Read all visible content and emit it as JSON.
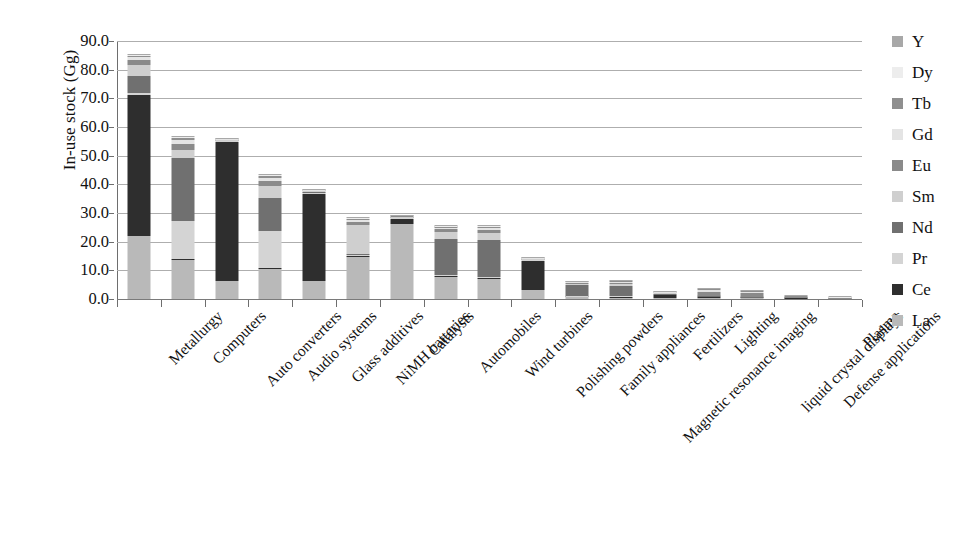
{
  "chart_data": {
    "type": "bar",
    "subtype": "stacked-bar",
    "title": "",
    "xlabel": "",
    "ylabel": "In-use stock (Gg)",
    "ylim": [
      0,
      90
    ],
    "ytick_labels": [
      "90.0",
      "80.0",
      "70.0",
      "60.0",
      "50.0",
      "40.0",
      "30.0",
      "20.0",
      "10.0",
      "0.0"
    ],
    "ytick_values": [
      90,
      80,
      70,
      60,
      50,
      40,
      30,
      20,
      10,
      0
    ],
    "grid": true,
    "legend_position": "right",
    "categories": [
      "Metallurgy",
      "Computers",
      "Auto converters",
      "Audio systems",
      "Glass additives",
      "NiMH batteries",
      "Catalysts",
      "Automobiles",
      "Wind turbines",
      "Polishing powders",
      "Family appliances",
      "Magnetic resonance imaging",
      "Fertilizers",
      "Lighting",
      "liquid crystal displays",
      "Defense applications",
      "Plasma"
    ],
    "series": [
      {
        "name": "La",
        "color": "#b9b9b9",
        "values": [
          22.0,
          13.5,
          6.2,
          10.3,
          6.3,
          14.5,
          26.0,
          7.6,
          7.0,
          3.0,
          0.6,
          0.5,
          0.4,
          0.5,
          0.3,
          0.25,
          0.12
        ]
      },
      {
        "name": "Ce",
        "color": "#2e2e2e",
        "values": [
          49.0,
          0.6,
          48.5,
          0.5,
          30.5,
          0.5,
          1.8,
          0.4,
          0.3,
          10.2,
          0.3,
          0.3,
          1.0,
          0.2,
          0.15,
          0.1,
          0.05
        ]
      },
      {
        "name": "Pr",
        "color": "#d4d4d4",
        "values": [
          0.8,
          13.0,
          0.3,
          13.0,
          0.4,
          0.4,
          0.4,
          0.3,
          0.3,
          0.3,
          0.2,
          0.2,
          0.2,
          0.15,
          0.1,
          0.05,
          0.02
        ]
      },
      {
        "name": "Nd",
        "color": "#707070",
        "values": [
          6.0,
          22.0,
          0.3,
          11.5,
          0.3,
          0.3,
          0.3,
          12.5,
          13.0,
          0.3,
          3.8,
          3.7,
          0.3,
          0.15,
          0.1,
          0.05,
          0.02
        ]
      },
      {
        "name": "Sm",
        "color": "#cfcfcf",
        "values": [
          4.0,
          3.0,
          0.2,
          4.0,
          0.2,
          10.0,
          0.2,
          2.5,
          2.6,
          0.2,
          0.5,
          0.5,
          0.2,
          0.1,
          0.08,
          0.04,
          0.01
        ]
      },
      {
        "name": "Eu",
        "color": "#8a8a8a",
        "values": [
          1.5,
          2.0,
          0.2,
          2.0,
          0.2,
          1.0,
          0.2,
          1.0,
          1.0,
          0.2,
          0.3,
          0.3,
          0.15,
          1.5,
          1.2,
          0.3,
          0.3
        ]
      },
      {
        "name": "Gd",
        "color": "#e4e4e4",
        "values": [
          1.0,
          1.5,
          0.1,
          1.0,
          0.1,
          0.8,
          0.1,
          0.6,
          0.6,
          0.1,
          0.2,
          0.6,
          0.1,
          0.4,
          0.5,
          0.1,
          0.05
        ]
      },
      {
        "name": "Tb",
        "color": "#8f8f8f",
        "values": [
          0.6,
          0.6,
          0.1,
          0.5,
          0.1,
          0.4,
          0.1,
          0.4,
          0.4,
          0.1,
          0.1,
          0.2,
          0.05,
          0.4,
          0.3,
          0.08,
          0.02
        ]
      },
      {
        "name": "Dy",
        "color": "#ededed",
        "values": [
          0.3,
          0.4,
          0.05,
          0.3,
          0.05,
          0.3,
          0.05,
          0.3,
          0.3,
          0.05,
          0.1,
          0.15,
          0.05,
          0.3,
          0.2,
          0.05,
          0.02
        ]
      },
      {
        "name": "Y",
        "color": "#a8a8a8",
        "values": [
          0.3,
          0.4,
          0.05,
          0.4,
          0.05,
          0.3,
          0.05,
          0.3,
          0.3,
          0.05,
          0.1,
          0.15,
          0.05,
          0.3,
          0.2,
          0.05,
          0.02
        ]
      }
    ],
    "totals": [
      85.5,
      57.0,
      56.0,
      43.5,
      38.2,
      28.5,
      29.2,
      25.9,
      25.8,
      14.5,
      6.2,
      6.6,
      2.5,
      3.6,
      3.13,
      1.07,
      0.63
    ],
    "legend_order": [
      "Y",
      "Dy",
      "Tb",
      "Gd",
      "Eu",
      "Sm",
      "Nd",
      "Pr",
      "Ce",
      "La"
    ],
    "axis_color": "#6e6e6e",
    "grid_color": "#aeaeae",
    "background": "#ffffff"
  }
}
